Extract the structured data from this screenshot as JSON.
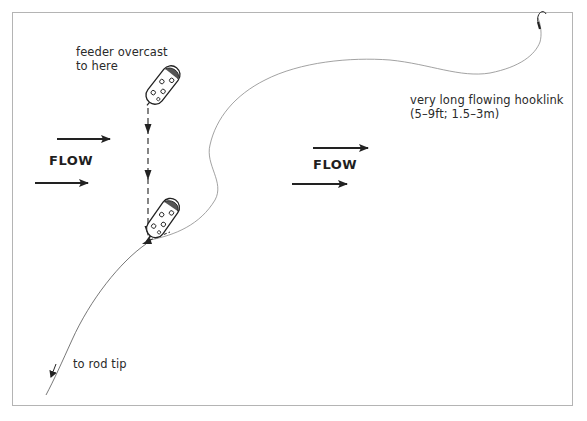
{
  "diagram": {
    "title": "",
    "labels": {
      "feeder_line1": "feeder overcast",
      "feeder_line2": "to here",
      "hooklink_line1": "very long flowing hooklink",
      "hooklink_line2": "(5–9ft; 1.5–3m)",
      "rod_tip": "to rod tip",
      "flow_left": "FLOW",
      "flow_right": "FLOW"
    },
    "elements": [
      {
        "name": "feeder-overcast-position",
        "icon": "feeder-icon"
      },
      {
        "name": "feeder-settled-position",
        "icon": "feeder-icon"
      },
      {
        "name": "hook",
        "icon": "hook-icon"
      },
      {
        "name": "main-line",
        "to": "rod tip"
      },
      {
        "name": "hooklink",
        "length": "5–9ft; 1.5–3m"
      },
      {
        "name": "flow-arrows",
        "direction": "left-to-right",
        "count": 4
      }
    ],
    "colors": {
      "line": "#222222",
      "frame": "#b4b4b4",
      "text": "#2a2a2a",
      "background": "#ffffff"
    }
  }
}
